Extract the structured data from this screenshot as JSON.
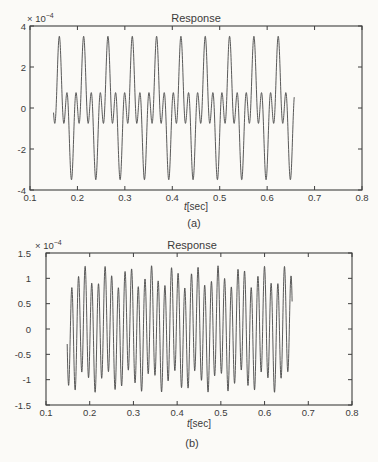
{
  "figure": {
    "background": "#fbfaf7",
    "axis_color": "#3e3e3e",
    "text_color": "#3b3b3b"
  },
  "chart_data": [
    {
      "type": "line",
      "panel": "a",
      "title": "Response",
      "xlabel": "t[sec]",
      "xlabel_italic_part": "t",
      "xlabel_rest": "[sec]",
      "scale_label": {
        "base": "× 10",
        "exponent": "−4"
      },
      "caption": "(a)",
      "xlim": [
        0.1,
        0.8
      ],
      "ylim": [
        -4,
        4
      ],
      "y_unit_multiplier": "1e-4",
      "xtick_values": [
        0.1,
        0.2,
        0.3,
        0.4,
        0.5,
        0.6,
        0.7,
        0.8
      ],
      "xtick_labels": [
        "0.1",
        "0.2",
        "0.3",
        "0.4",
        "0.5",
        "0.6",
        "0.7",
        "0.8"
      ],
      "ytick_values": [
        4,
        2,
        0,
        -2,
        -4
      ],
      "ytick_labels": [
        "4",
        "2",
        "0",
        "-2",
        "-4"
      ],
      "grid": false,
      "legend": null,
      "line_color": "#474747",
      "signal": {
        "t_start": 0.1497,
        "t_end": 0.657,
        "t0": 0.149,
        "components": [
          {
            "amplitude": 1.9,
            "freq_hz": 19.5,
            "phase_rad": 0
          },
          {
            "amplitude": -1.6,
            "freq_hz": 58.5,
            "phase_rad": 0
          }
        ],
        "peak_value": 3.5,
        "trough_value": -3.5,
        "big_peak_count": 10
      }
    },
    {
      "type": "line",
      "panel": "b",
      "title": "Response",
      "xlabel": "t[sec]",
      "xlabel_italic_part": "t",
      "xlabel_rest": "[sec]",
      "scale_label": {
        "base": "× 10",
        "exponent": "−4"
      },
      "caption": "(b)",
      "xlim": [
        0.1,
        0.8
      ],
      "ylim": [
        -1.5,
        1.5
      ],
      "y_unit_multiplier": "1e-4",
      "xtick_values": [
        0.1,
        0.2,
        0.3,
        0.4,
        0.5,
        0.6,
        0.7,
        0.8
      ],
      "xtick_labels": [
        "0.1",
        "0.2",
        "0.3",
        "0.4",
        "0.5",
        "0.6",
        "0.7",
        "0.8"
      ],
      "ytick_values": [
        1.5,
        1,
        0.5,
        0,
        -0.5,
        -1,
        -1.5
      ],
      "ytick_labels": [
        "1.5",
        "1",
        "0.5",
        "0",
        "-0.5",
        "-1",
        "-1.5"
      ],
      "grid": false,
      "legend": null,
      "line_color": "#474747",
      "signal": {
        "t_start": 0.1485,
        "t_end": 0.663,
        "t0": 0.1485,
        "components": [
          {
            "amplitude": -0.22,
            "freq_hz": 19.5,
            "phase_rad": 0
          },
          {
            "amplitude": -1.03,
            "freq_hz": 65.8,
            "phase_rad": 0.3
          }
        ],
        "envelope_max": 1.25,
        "envelope_min": 0.8,
        "modulation_group_count": 10
      }
    }
  ]
}
